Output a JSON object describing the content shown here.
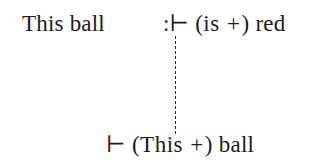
{
  "figure": {
    "background_color": "#ffffff",
    "text_color": "#1b1b1b",
    "connector_color": "#2a2a2a",
    "top_row": {
      "subject": "This ball",
      "judgement_symbol": ":⊢",
      "open_paren": "(",
      "type_word": "is",
      "plus": "+",
      "close_paren": ")",
      "result_word": "red"
    },
    "bottom_row": {
      "turnstile": "⊢",
      "open_paren": "(",
      "type_word": "This",
      "plus": "+",
      "close_paren": ")",
      "result_word": "ball"
    },
    "connector": {
      "style": "dashed-vertical",
      "label": ""
    }
  }
}
